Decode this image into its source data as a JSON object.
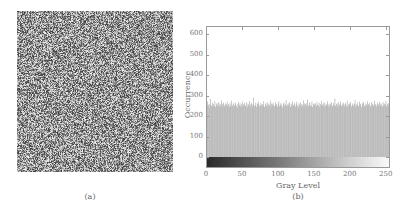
{
  "panel_a": {
    "caption": "(a)",
    "description": "random-noise-encrypted-image",
    "seed": 12345
  },
  "panel_b": {
    "caption": "(b)"
  },
  "chart_data": {
    "type": "bar",
    "title": "",
    "xlabel": "Gray Level",
    "ylabel": "Occurrence",
    "xlim": [
      0,
      255
    ],
    "ylim": [
      -60,
      640
    ],
    "xticks": [
      0,
      50,
      100,
      150,
      200,
      250
    ],
    "yticks": [
      0,
      100,
      200,
      300,
      400,
      500,
      600
    ],
    "grid": false,
    "legend": null,
    "colorbar": {
      "position": "below-baseline",
      "from": "#2a2a2a",
      "to": "#fafafa"
    },
    "bar_color": "#9a9a9a",
    "values": [
      262,
      248,
      270,
      255,
      241,
      259,
      283,
      251,
      246,
      266,
      258,
      249,
      272,
      244,
      257,
      263,
      250,
      268,
      245,
      260,
      254,
      276,
      247,
      259,
      265,
      252,
      243,
      261,
      256,
      270,
      249,
      258,
      244,
      263,
      251,
      274,
      246,
      255,
      262,
      248,
      257,
      266,
      250,
      241,
      259,
      269,
      253,
      262,
      247,
      256,
      271,
      245,
      258,
      264,
      252,
      249,
      267,
      243,
      260,
      255,
      273,
      246,
      257,
      263,
      250,
      259,
      289,
      248,
      254,
      266,
      244,
      261,
      257,
      270,
      251,
      246,
      263,
      255,
      258,
      249,
      272,
      244,
      256,
      262,
      250,
      267,
      247,
      259,
      254,
      275,
      242,
      261,
      256,
      265,
      250,
      248,
      269,
      253,
      258,
      245,
      262,
      271,
      249,
      256,
      264,
      251,
      243,
      259,
      266,
      252,
      257,
      278,
      247,
      255,
      261,
      249,
      268,
      244,
      260,
      253,
      272,
      250,
      256,
      264,
      246,
      258,
      270,
      251,
      243,
      262,
      255,
      267,
      248,
      259,
      254,
      276,
      245,
      261,
      257,
      263,
      250,
      281,
      247,
      256,
      266,
      252,
      249,
      271,
      244,
      258,
      263,
      253,
      260,
      247,
      269,
      255,
      251,
      264,
      242,
      258,
      273,
      250,
      256,
      262,
      246,
      266,
      252,
      259,
      249,
      272,
      255,
      244,
      261,
      257,
      268,
      250,
      247,
      263,
      254,
      285,
      249,
      258,
      262,
      245,
      267,
      253,
      256,
      271,
      248,
      260,
      252,
      265,
      246,
      258,
      263,
      250,
      274,
      244,
      257,
      261,
      253,
      268,
      247,
      255,
      262,
      250,
      259,
      277,
      245,
      256,
      266,
      251,
      248,
      270,
      254,
      260,
      243,
      263,
      257,
      269,
      250,
      246,
      261,
      255,
      272,
      249,
      258,
      264,
      251,
      244,
      267,
      256,
      260,
      248,
      273,
      253,
      259,
      246,
      265,
      252,
      257,
      270,
      249,
      262,
      255,
      245,
      268,
      251,
      260,
      256,
      274,
      247,
      258,
      263,
      250,
      266,
      254,
      261,
      248,
      271,
      253
    ]
  }
}
